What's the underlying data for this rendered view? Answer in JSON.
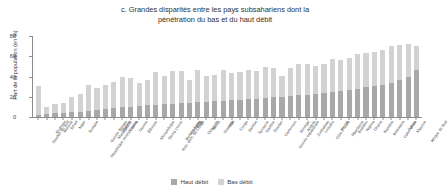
{
  "chart_data": {
    "type": "bar",
    "stacked": true,
    "title": "c. Grandes disparités entre les pays subsahariens dont la pénétration du bas et du haut débit",
    "title_lines": [
      "c. Grandes disparités entre les pays subsahariens dont la",
      "pénétration du bas et du haut débit"
    ],
    "xlabel": "",
    "ylabel": "Part de la population (en %)",
    "ylim": [
      0,
      80
    ],
    "yticks": [
      0,
      20,
      40,
      60,
      80
    ],
    "ytick_labels": [
      "0",
      "20",
      "40",
      "60",
      "80"
    ],
    "grid": false,
    "legend_position": "bottom",
    "categories": [
      "Soudan du Sud",
      "Érythrée",
      "Burundi",
      "Tchad",
      "Niger",
      "Somalie",
      "République centrafricaine",
      "Guinée-Bissau",
      "Madagascar",
      "Malawi",
      "Libéria",
      "Guinée",
      "Éthiopie",
      "Mozambique",
      "Sierra Leone",
      "Rép. dém. du Congo",
      "Burkina Faso",
      "Comores",
      "Togo",
      "Ouganda",
      "Bénin",
      "Rwanda",
      "Mali",
      "Congo",
      "Zambie",
      "Tanzanie",
      "Gambie",
      "Soudan",
      "Cameroun",
      "Guinée équatoriale",
      "Sénégal",
      "Angola",
      "Zimbabwe",
      "Lesotho",
      "Côte d'Ivoire",
      "Kenya",
      "Mauritanie",
      "Eswatini",
      "Nigéria",
      "Ghana",
      "Namibie",
      "Botswana",
      "Cabo Verde",
      "Gabon",
      "Maurice",
      "Afrique du Sud"
    ],
    "series": [
      {
        "name": "Haut débit",
        "color": "#a8a8a8",
        "values": [
          2,
          3,
          4,
          4,
          5,
          5,
          6,
          7,
          8,
          9,
          10,
          10,
          11,
          12,
          12,
          13,
          13,
          14,
          14,
          15,
          15,
          16,
          16,
          17,
          17,
          18,
          18,
          19,
          20,
          20,
          21,
          22,
          22,
          23,
          24,
          25,
          26,
          27,
          28,
          30,
          31,
          32,
          34,
          37,
          40,
          46
        ]
      },
      {
        "name": "Bas débit",
        "color": "#d2d2d2",
        "values": [
          29,
          7,
          9,
          10,
          15,
          18,
          26,
          22,
          24,
          26,
          30,
          29,
          23,
          25,
          32,
          28,
          32,
          31,
          23,
          31,
          26,
          26,
          30,
          26,
          27,
          28,
          27,
          30,
          28,
          21,
          27,
          30,
          30,
          27,
          28,
          32,
          30,
          31,
          34,
          33,
          33,
          34,
          36,
          34,
          32,
          24
        ]
      }
    ]
  },
  "legend": {
    "items": [
      {
        "label": "Haut débit",
        "swatch": "haut"
      },
      {
        "label": "Bas débit",
        "swatch": "bas"
      }
    ]
  }
}
